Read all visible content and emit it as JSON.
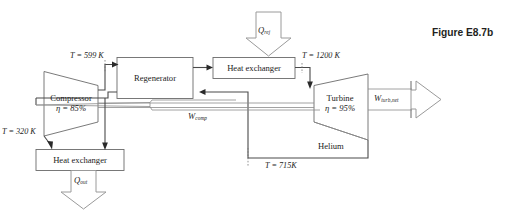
{
  "figure": {
    "caption": "Figure E8.7b",
    "working_fluid": "Helium"
  },
  "components": {
    "compressor": {
      "name": "Compressor",
      "efficiency_label": "η = 85%"
    },
    "turbine": {
      "name": "Turbine",
      "efficiency_label": "η = 95%"
    },
    "regenerator": {
      "name": "Regenerator"
    },
    "heat_exchanger_top": {
      "name": "Heat exchanger"
    },
    "heat_exchanger_bottom": {
      "name": "Heat exchanger"
    }
  },
  "state_labels": {
    "compressor_inlet_temp": "T = 320 K",
    "compressor_outlet_temp": "T = 599 K",
    "turbine_inlet_temp": "T = 1200 K",
    "turbine_outlet_temp": "T = 715K"
  },
  "energy_labels": {
    "heat_in_symbol": "Q",
    "heat_in_subscript": "rej",
    "heat_out_symbol": "Q",
    "heat_out_subscript": "out",
    "work_comp_symbol": "W",
    "work_comp_subscript": "comp",
    "work_net_symbol": "W",
    "work_net_subscript": "turb,net"
  },
  "colors": {
    "stroke": "#555555",
    "box_stroke": "#6b6b6b",
    "arrow_outline": "#9a9a9a",
    "text": "#1c1c1c",
    "caption": "#231f20",
    "background": "#ffffff"
  }
}
